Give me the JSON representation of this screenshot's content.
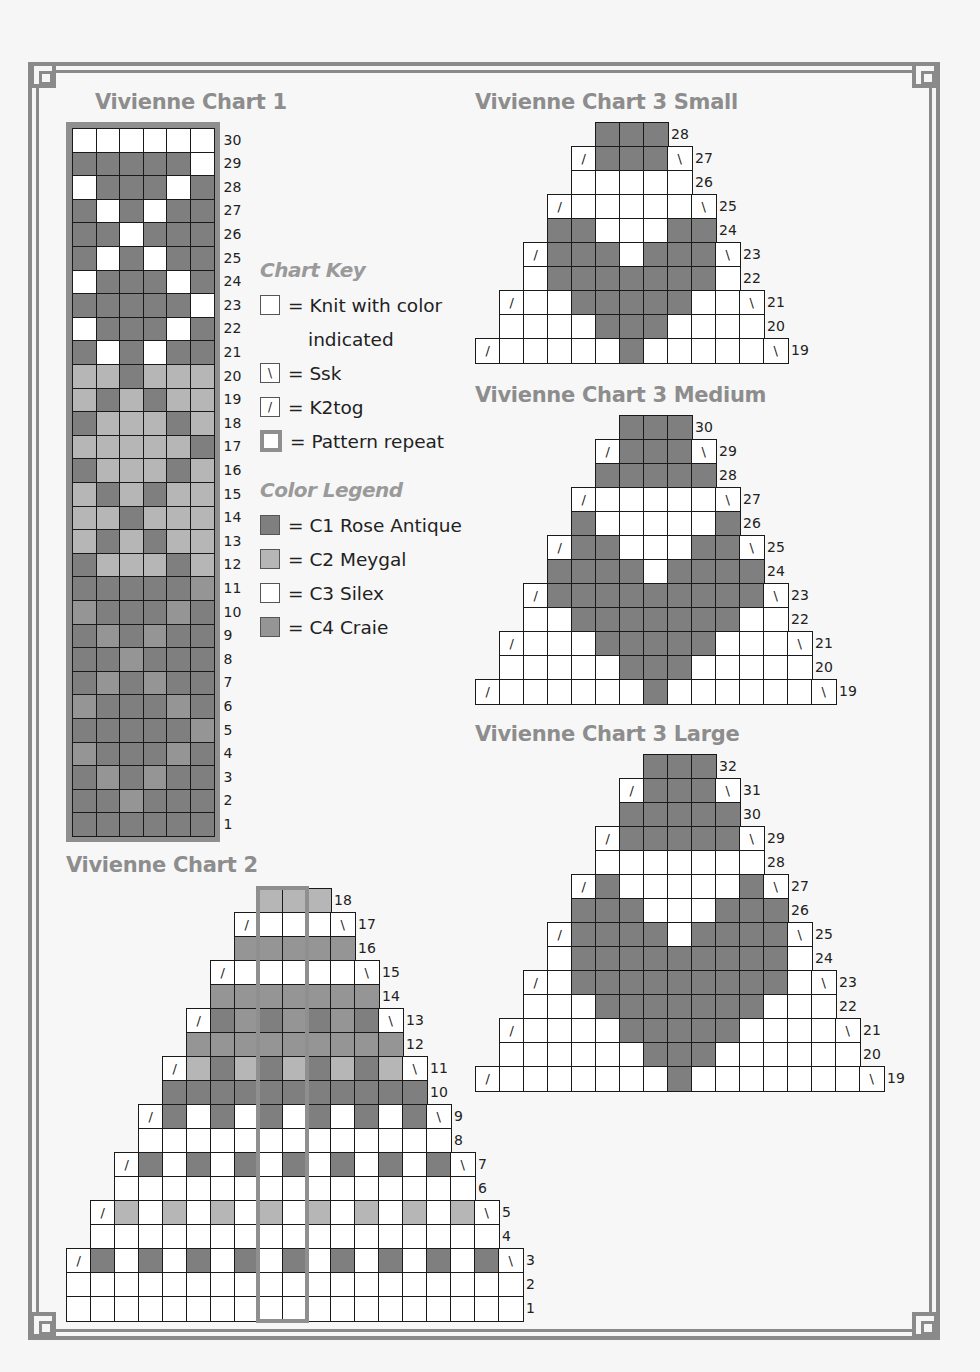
{
  "colors": {
    "C1": "#7f7f7f",
    "C2": "#b6b6b6",
    "C3": "#ffffff",
    "C4": "#959595",
    "frame": "#8a8a8a",
    "title": "#8d8d8d"
  },
  "chart_key": {
    "heading": "Chart Key",
    "items": [
      {
        "symbol": "",
        "label": "= Knit with color",
        "continuation": "indicated"
      },
      {
        "symbol": "\\",
        "label": "= Ssk"
      },
      {
        "symbol": "/",
        "label": "= K2tog"
      },
      {
        "symbol": "repeat",
        "label": "= Pattern repeat"
      }
    ]
  },
  "color_legend": {
    "heading": "Color Legend",
    "items": [
      {
        "code": "C1",
        "label": "= C1 Rose Antique"
      },
      {
        "code": "C2",
        "label": "= C2 Meygal"
      },
      {
        "code": "C3",
        "label": "= C3 Silex"
      },
      {
        "code": "C4",
        "label": "= C4 Craie"
      }
    ]
  },
  "charts": [
    {
      "id": "chart1",
      "title": "Vivienne Chart 1",
      "title_pos": [
        95,
        90
      ],
      "cell": 23.6,
      "origin": [
        72,
        128
      ],
      "bordered": true,
      "rows": [
        {
          "n": 30,
          "offset": 0,
          "cells": "W W W W W W"
        },
        {
          "n": 29,
          "offset": 0,
          "cells": "D D D D D W"
        },
        {
          "n": 28,
          "offset": 0,
          "cells": "W D D D W D"
        },
        {
          "n": 27,
          "offset": 0,
          "cells": "D W D W D D"
        },
        {
          "n": 26,
          "offset": 0,
          "cells": "D D W D D D"
        },
        {
          "n": 25,
          "offset": 0,
          "cells": "D W D W D D"
        },
        {
          "n": 24,
          "offset": 0,
          "cells": "W D D D W D"
        },
        {
          "n": 23,
          "offset": 0,
          "cells": "D D D D D W"
        },
        {
          "n": 22,
          "offset": 0,
          "cells": "W D D D W D"
        },
        {
          "n": 21,
          "offset": 0,
          "cells": "D W D W D D"
        },
        {
          "n": 20,
          "offset": 0,
          "cells": "L L D L L L"
        },
        {
          "n": 19,
          "offset": 0,
          "cells": "L D L D L L"
        },
        {
          "n": 18,
          "offset": 0,
          "cells": "D L L L D L"
        },
        {
          "n": 17,
          "offset": 0,
          "cells": "L L L L L D"
        },
        {
          "n": 16,
          "offset": 0,
          "cells": "D L L L D L"
        },
        {
          "n": 15,
          "offset": 0,
          "cells": "L D L D L L"
        },
        {
          "n": 14,
          "offset": 0,
          "cells": "L L D L L L"
        },
        {
          "n": 13,
          "offset": 0,
          "cells": "L D L D L L"
        },
        {
          "n": 12,
          "offset": 0,
          "cells": "D L L L D L"
        },
        {
          "n": 11,
          "offset": 0,
          "cells": "D D D D D M"
        },
        {
          "n": 10,
          "offset": 0,
          "cells": "M D D D M D"
        },
        {
          "n": 9,
          "offset": 0,
          "cells": "D M D M D D"
        },
        {
          "n": 8,
          "offset": 0,
          "cells": "D D M D D D"
        },
        {
          "n": 7,
          "offset": 0,
          "cells": "D M D M D D"
        },
        {
          "n": 6,
          "offset": 0,
          "cells": "M D D D M D"
        },
        {
          "n": 5,
          "offset": 0,
          "cells": "D D D D D M"
        },
        {
          "n": 4,
          "offset": 0,
          "cells": "M D D D M D"
        },
        {
          "n": 3,
          "offset": 0,
          "cells": "D M D M D D"
        },
        {
          "n": 2,
          "offset": 0,
          "cells": "D D M D D D"
        },
        {
          "n": 1,
          "offset": 0,
          "cells": "D D D D D D"
        }
      ]
    },
    {
      "id": "chart2",
      "title": "Vivienne Chart 2",
      "title_pos": [
        66,
        853
      ],
      "cell": 24,
      "origin": [
        66,
        888
      ],
      "repeat_cols": [
        8,
        9
      ],
      "rows": [
        {
          "n": 18,
          "offset": 8,
          "cells": "L L L"
        },
        {
          "n": 17,
          "offset": 7,
          "cells": "/ W W W \\"
        },
        {
          "n": 16,
          "offset": 7,
          "cells": "M M M M M"
        },
        {
          "n": 15,
          "offset": 6,
          "cells": "/ W W W W W \\"
        },
        {
          "n": 14,
          "offset": 6,
          "cells": "M M M M M M M"
        },
        {
          "n": 13,
          "offset": 5,
          "cells": "/ D M D M D M D \\"
        },
        {
          "n": 12,
          "offset": 5,
          "cells": "M M M M M M M M M"
        },
        {
          "n": 11,
          "offset": 4,
          "cells": "/ L D L D L D L D L \\"
        },
        {
          "n": 10,
          "offset": 4,
          "cells": "D D D D D D D D D D D"
        },
        {
          "n": 9,
          "offset": 3,
          "cells": "/ D W D W D W D W D W D \\"
        },
        {
          "n": 8,
          "offset": 3,
          "cells": "W W W W W W W W W W W W W"
        },
        {
          "n": 7,
          "offset": 2,
          "cells": "/ D W D W D W D W D W D W D \\"
        },
        {
          "n": 6,
          "offset": 2,
          "cells": "W W W W W W W W W W W W W W W"
        },
        {
          "n": 5,
          "offset": 1,
          "cells": "/ L W L W L W L W L W L W L W L \\"
        },
        {
          "n": 4,
          "offset": 1,
          "cells": "W W W W W W W W W W W W W W W W W"
        },
        {
          "n": 3,
          "offset": 0,
          "cells": "/ D W D W D W D W D W D W D W D W D \\"
        },
        {
          "n": 2,
          "offset": 0,
          "cells": "W W W W W W W W W W W W W W W W W W W"
        },
        {
          "n": 1,
          "offset": 0,
          "cells": "W W W W W W W W W W W W W W W W W W W"
        }
      ]
    },
    {
      "id": "chart3s",
      "title": "Vivienne Chart 3 Small",
      "title_pos": [
        475,
        90
      ],
      "cell": 24,
      "origin": [
        475,
        122
      ],
      "rows": [
        {
          "n": 28,
          "offset": 5,
          "cells": "D D D"
        },
        {
          "n": 27,
          "offset": 4,
          "cells": "/ D D D \\"
        },
        {
          "n": 26,
          "offset": 4,
          "cells": "W W W W W"
        },
        {
          "n": 25,
          "offset": 3,
          "cells": "/ W W W W W \\"
        },
        {
          "n": 24,
          "offset": 3,
          "cells": "D D W W W D D"
        },
        {
          "n": 23,
          "offset": 2,
          "cells": "/ D D D W D D D \\"
        },
        {
          "n": 22,
          "offset": 2,
          "cells": "W D D D D D D D W"
        },
        {
          "n": 21,
          "offset": 1,
          "cells": "/ W W D D D D D W W \\"
        },
        {
          "n": 20,
          "offset": 1,
          "cells": "W W W W D D D W W W W"
        },
        {
          "n": 19,
          "offset": 0,
          "cells": "/ W W W W W D W W W W W \\"
        }
      ]
    },
    {
      "id": "chart3m",
      "title": "Vivienne Chart 3 Medium",
      "title_pos": [
        475,
        383
      ],
      "cell": 24,
      "origin": [
        475,
        415
      ],
      "rows": [
        {
          "n": 30,
          "offset": 6,
          "cells": "D D D"
        },
        {
          "n": 29,
          "offset": 5,
          "cells": "/ D D D \\"
        },
        {
          "n": 28,
          "offset": 5,
          "cells": "D D D D D"
        },
        {
          "n": 27,
          "offset": 4,
          "cells": "/ W W W W W \\"
        },
        {
          "n": 26,
          "offset": 4,
          "cells": "D W W W W W D"
        },
        {
          "n": 25,
          "offset": 3,
          "cells": "/ D D W W W D D \\"
        },
        {
          "n": 24,
          "offset": 3,
          "cells": "D D D D W D D D D"
        },
        {
          "n": 23,
          "offset": 2,
          "cells": "/ D D D D D D D D D \\"
        },
        {
          "n": 22,
          "offset": 2,
          "cells": "W W D D D D D D D W W"
        },
        {
          "n": 21,
          "offset": 1,
          "cells": "/ W W W D D D D D W W W \\"
        },
        {
          "n": 20,
          "offset": 1,
          "cells": "W W W W W D D D W W W W W"
        },
        {
          "n": 19,
          "offset": 0,
          "cells": "/ W W W W W W D W W W W W W \\"
        }
      ]
    },
    {
      "id": "chart3l",
      "title": "Vivienne Chart 3 Large",
      "title_pos": [
        475,
        722
      ],
      "cell": 24,
      "origin": [
        475,
        754
      ],
      "rows": [
        {
          "n": 32,
          "offset": 7,
          "cells": "D D D"
        },
        {
          "n": 31,
          "offset": 6,
          "cells": "/ D D D \\"
        },
        {
          "n": 30,
          "offset": 6,
          "cells": "D D D D D"
        },
        {
          "n": 29,
          "offset": 5,
          "cells": "/ D D D D D \\"
        },
        {
          "n": 28,
          "offset": 5,
          "cells": "W W W W W W W"
        },
        {
          "n": 27,
          "offset": 4,
          "cells": "/ D W W W W W D \\"
        },
        {
          "n": 26,
          "offset": 4,
          "cells": "D D D W W W D D D"
        },
        {
          "n": 25,
          "offset": 3,
          "cells": "/ D D D D W D D D D \\"
        },
        {
          "n": 24,
          "offset": 3,
          "cells": "W D D D D D D D D D W"
        },
        {
          "n": 23,
          "offset": 2,
          "cells": "/ W D D D D D D D D D W \\"
        },
        {
          "n": 22,
          "offset": 2,
          "cells": "W W W D D D D D D D W W W"
        },
        {
          "n": 21,
          "offset": 1,
          "cells": "/ W W W W D D D D D W W W W \\"
        },
        {
          "n": 20,
          "offset": 1,
          "cells": "W W W W W W D D D W W W W W W"
        },
        {
          "n": 19,
          "offset": 0,
          "cells": "/ W W W W W W W D W W W W W W W \\"
        }
      ]
    }
  ]
}
